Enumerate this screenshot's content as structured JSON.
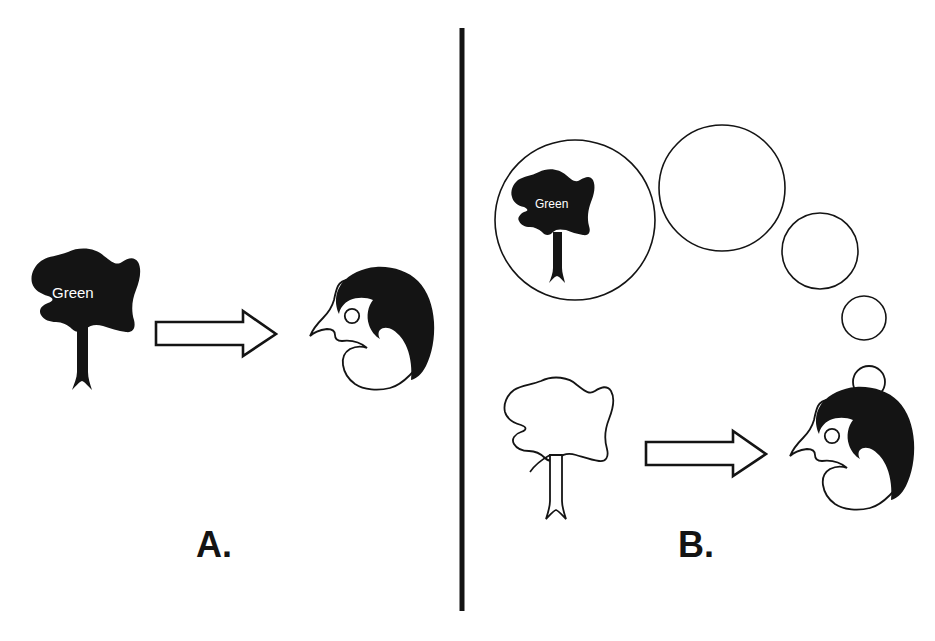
{
  "figure": {
    "background_color": "#ffffff",
    "ink_color": "#141414",
    "width": 935,
    "height": 641,
    "divider": {
      "name": "vertical-divider",
      "x": 462,
      "y_top": 28,
      "y_bottom": 611,
      "thickness": 5,
      "color": "#141414"
    }
  },
  "panels": [
    {
      "id": "A",
      "label": "A.",
      "label_x": 196,
      "label_y": 527,
      "elements": {
        "tree": {
          "name": "black-tree-filled",
          "fill": "#141414",
          "word_on_crown": "Green",
          "word_color": "#ffffff"
        },
        "arrow": {
          "name": "right-arrow-outline",
          "direction": "right",
          "fill": "#ffffff",
          "stroke": "#141414"
        },
        "head": {
          "name": "profile-head-left-facing",
          "hair_fill": "#141414",
          "face_fill": "#ffffff",
          "eye": "open-circle"
        }
      }
    },
    {
      "id": "B",
      "label": "B.",
      "label_x": 678,
      "label_y": 527,
      "elements": {
        "thought_bubbles": [
          {
            "name": "thought-bubble-large",
            "cx": 575,
            "cy": 220,
            "r": 80,
            "contains": "black-tree-filled"
          },
          {
            "name": "thought-bubble-medium",
            "cx": 722,
            "cy": 188,
            "r": 63
          },
          {
            "name": "thought-bubble-small",
            "cx": 820,
            "cy": 251,
            "r": 38
          },
          {
            "name": "thought-bubble-tiny",
            "cx": 864,
            "cy": 318,
            "r": 22
          },
          {
            "name": "thought-bubble-tail",
            "cx": 869,
            "cy": 382,
            "r": 16
          }
        ],
        "bubble_tree": {
          "name": "black-tree-filled-in-bubble",
          "fill": "#141414",
          "word_on_crown": "Green",
          "word_color": "#ffffff"
        },
        "tree": {
          "name": "outline-tree-unfilled",
          "fill": "#ffffff",
          "stroke": "#141414",
          "word_on_crown": null
        },
        "arrow": {
          "name": "right-arrow-outline",
          "direction": "right",
          "fill": "#ffffff",
          "stroke": "#141414"
        },
        "head": {
          "name": "profile-head-left-facing",
          "hair_fill": "#141414",
          "face_fill": "#ffffff",
          "eye": "open-circle"
        }
      }
    }
  ]
}
